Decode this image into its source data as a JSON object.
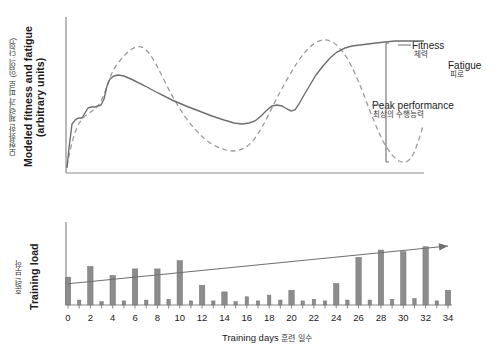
{
  "figure": {
    "background": "#ffffff",
    "axis_color": "#8a8a8a",
    "fitness_color": "#6e6e6e",
    "fatigue_color": "#9a9a9a",
    "bar_color": "#8c8c8c",
    "bar_edge_color": "#6f6f6f",
    "trend_color": "#6e6e6e"
  },
  "top_panel": {
    "ylabel_en": "Modeled fitness and fatigue (arbitrary units)",
    "ylabel_ko": "모형화한 체력과 피로 (임의 단위)",
    "annotations": [
      {
        "name": "fitness",
        "en": "Fitness",
        "ko": "체력"
      },
      {
        "name": "fatigue",
        "en": "Fatigue",
        "ko": "피로"
      },
      {
        "name": "peak-performance",
        "en": "Peak performance",
        "ko": "최상의 수행능력"
      }
    ]
  },
  "bottom_panel": {
    "ylabel_en": "Training load",
    "ylabel_ko": "훈련 부하",
    "xlabel_en": "Training days",
    "xlabel_ko": "훈련 일수"
  },
  "chart_data": [
    {
      "type": "line",
      "name": "fitness-fatigue-panel",
      "title": "Modeled fitness and fatigue (arbitrary units)",
      "xlabel": "",
      "ylabel": "Modeled fitness and fatigue (arbitrary units)",
      "xlim": [
        0,
        35
      ],
      "ylim": [
        0,
        100
      ],
      "grid": false,
      "legend": "inline-annotations",
      "axis_ticks": false,
      "series": [
        {
          "name": "Fitness",
          "style": "solid",
          "color": "#6e6e6e",
          "x": [
            0,
            1,
            2,
            3,
            4,
            5,
            6,
            7,
            8,
            9,
            10,
            11,
            12,
            13,
            14,
            15,
            16,
            17,
            18,
            19,
            20,
            21,
            22,
            23,
            24,
            25,
            26,
            27,
            28,
            29,
            30,
            31,
            32,
            33,
            34,
            35
          ],
          "y": [
            20,
            34,
            40,
            41,
            44,
            50,
            53,
            66,
            69,
            68,
            66,
            64,
            62,
            60,
            58,
            56,
            54,
            52,
            50,
            48,
            47,
            49,
            57,
            56,
            55,
            54,
            56,
            61,
            62,
            60,
            58,
            57,
            58,
            65,
            76,
            84
          ]
        },
        {
          "name": "Fatigue",
          "style": "dashed",
          "color": "#9a9a9a",
          "x": [
            0,
            1,
            2,
            3,
            4,
            5,
            6,
            7,
            8,
            9,
            10,
            11,
            12,
            13,
            14,
            15,
            16,
            17,
            18,
            19,
            20,
            21,
            22,
            23,
            24,
            25,
            26,
            27,
            28,
            29,
            30,
            31,
            32,
            33,
            34,
            35
          ],
          "y": [
            20,
            40,
            48,
            52,
            58,
            64,
            80,
            86,
            82,
            72,
            62,
            55,
            50,
            45,
            40,
            34,
            30,
            29,
            32,
            38,
            44,
            50,
            58,
            66,
            74,
            80,
            84,
            83,
            76,
            62,
            46,
            33,
            26,
            22,
            21,
            28
          ]
        }
      ],
      "annotations": [
        {
          "text": "Fitness",
          "text_ko": "체력"
        },
        {
          "text": "Fatigue",
          "text_ko": "피로"
        },
        {
          "text": "Peak performance",
          "text_ko": "최상의 수행능력",
          "note": "vertical gap between fitness and fatigue curves near day 31"
        }
      ]
    },
    {
      "type": "bar",
      "name": "training-load-panel",
      "title": "Training load",
      "xlabel": "Training days",
      "ylabel": "Training load",
      "xlim": [
        -0.5,
        34.5
      ],
      "ylim": [
        0,
        100
      ],
      "grid": false,
      "tick_labels": [
        "0",
        "2",
        "4",
        "6",
        "8",
        "10",
        "12",
        "14",
        "16",
        "18",
        "20",
        "22",
        "24",
        "26",
        "28",
        "30",
        "32",
        "34"
      ],
      "tick_values": [
        0,
        2,
        4,
        6,
        8,
        10,
        12,
        14,
        16,
        18,
        20,
        22,
        24,
        26,
        28,
        30,
        32,
        34
      ],
      "categories": [
        0,
        1,
        2,
        3,
        4,
        5,
        6,
        7,
        8,
        9,
        10,
        11,
        12,
        13,
        14,
        15,
        16,
        17,
        18,
        19,
        20,
        21,
        22,
        23,
        24,
        25,
        26,
        27,
        28,
        29,
        30,
        31,
        32,
        33,
        34
      ],
      "values": [
        34,
        6,
        47,
        4,
        36,
        5,
        44,
        6,
        44,
        7,
        54,
        5,
        24,
        5,
        16,
        4,
        10,
        5,
        12,
        6,
        18,
        5,
        7,
        5,
        26,
        6,
        58,
        6,
        67,
        7,
        65,
        8,
        71,
        5,
        18
      ],
      "values_secondary": [
        0,
        0,
        0,
        0,
        0,
        0,
        0,
        0,
        0,
        0,
        0,
        0,
        0,
        0,
        0,
        0,
        0,
        0,
        0,
        0,
        0,
        0,
        0,
        0,
        0,
        0,
        0,
        0,
        0,
        0,
        0,
        0,
        0,
        0,
        0
      ],
      "overlay": {
        "type": "trend-arrow",
        "label": "increasing training load trend",
        "from": [
          0,
          26
        ],
        "to": [
          34,
          72
        ],
        "color": "#6e6e6e"
      }
    }
  ]
}
